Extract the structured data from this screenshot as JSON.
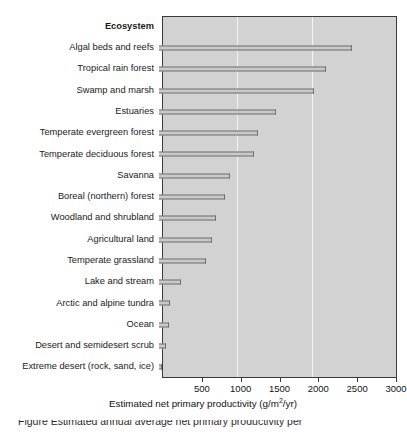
{
  "chart_data": {
    "type": "bar",
    "orientation": "horizontal",
    "title": "",
    "category_header": "Ecosystem",
    "xlabel": "Estimated net primary productivity (g/m2/yr)",
    "xlabel_parts": {
      "before": "Estimated net primary productivity (g/m",
      "sup": "2",
      "after": "/yr)"
    },
    "ylabel": "",
    "xlim": [
      0,
      3000
    ],
    "xticks": [
      500,
      1000,
      1500,
      2000,
      2500,
      3000
    ],
    "xtick_labels": [
      "500",
      "1000",
      "1500",
      "2000",
      "2500",
      "3000"
    ],
    "gridlines_at": [
      1000,
      2000
    ],
    "grid": true,
    "legend": "none",
    "categories": [
      "Algal beds and reefs",
      "Tropical rain forest",
      "Swamp and marsh",
      "Estuaries",
      "Temperate evergreen forest",
      "Temperate deciduous forest",
      "Savanna",
      "Boreal (northern) forest",
      "Woodland and shrubland",
      "Agricultural land",
      "Temperate grassland",
      "Lake and stream",
      "Arctic and alpine tundra",
      "Ocean",
      "Desert and semidesert scrub",
      "Extreme desert (rock, sand, ice)"
    ],
    "values": [
      2480,
      2150,
      2000,
      1500,
      1270,
      1220,
      920,
      850,
      730,
      680,
      600,
      280,
      140,
      130,
      90,
      40
    ]
  },
  "caption": {
    "text": "Figure     Estimated annual average net primary productivity per"
  },
  "colors": {
    "plot_background": "#d2d2d2",
    "bar_fill": "#c9c9c9",
    "bar_edge": "#6e6e6e",
    "gridline": "#f4f4f4",
    "frame": "#3a3a3a",
    "text": "#111111"
  }
}
